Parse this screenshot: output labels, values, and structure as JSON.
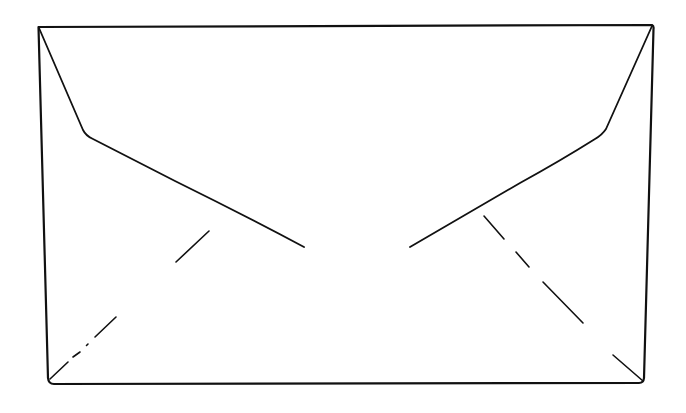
{
  "diagram": {
    "stroke_color": "#111111",
    "background_color": "#ffffff",
    "parts": [
      {
        "name": "envelope-outline",
        "style": "solid"
      },
      {
        "name": "top-flap-left-edge",
        "style": "solid"
      },
      {
        "name": "top-flap-right-edge",
        "style": "solid"
      },
      {
        "name": "left-fold-line",
        "style": "dash-dot"
      },
      {
        "name": "right-fold-line",
        "style": "dashed"
      }
    ]
  }
}
